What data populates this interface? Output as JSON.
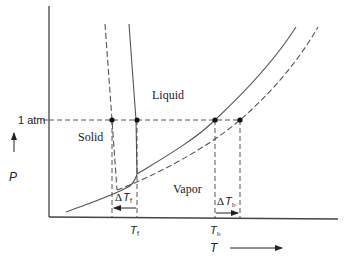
{
  "diagram": {
    "regions": {
      "liquid": "Liquid",
      "solid": "Solid",
      "vapor": "Vapor"
    },
    "axes": {
      "x_label": "T",
      "y_label": "P",
      "pressure_reference": "1 atm"
    },
    "markers": {
      "freezing_point": {
        "symbol": "T",
        "subscript": "f"
      },
      "boiling_point": {
        "symbol": "T",
        "subscript": "b"
      },
      "delta_freezing": {
        "prefix": "Δ",
        "symbol": "T",
        "subscript": "f"
      },
      "delta_boiling": {
        "prefix": "Δ",
        "symbol": "T",
        "subscript": "b"
      }
    },
    "legend": {
      "solid_line": "pure solvent",
      "dashed_line": "solution"
    },
    "colors": {
      "lines": "#555555",
      "text": "#222222",
      "background": "#ffffff"
    }
  }
}
